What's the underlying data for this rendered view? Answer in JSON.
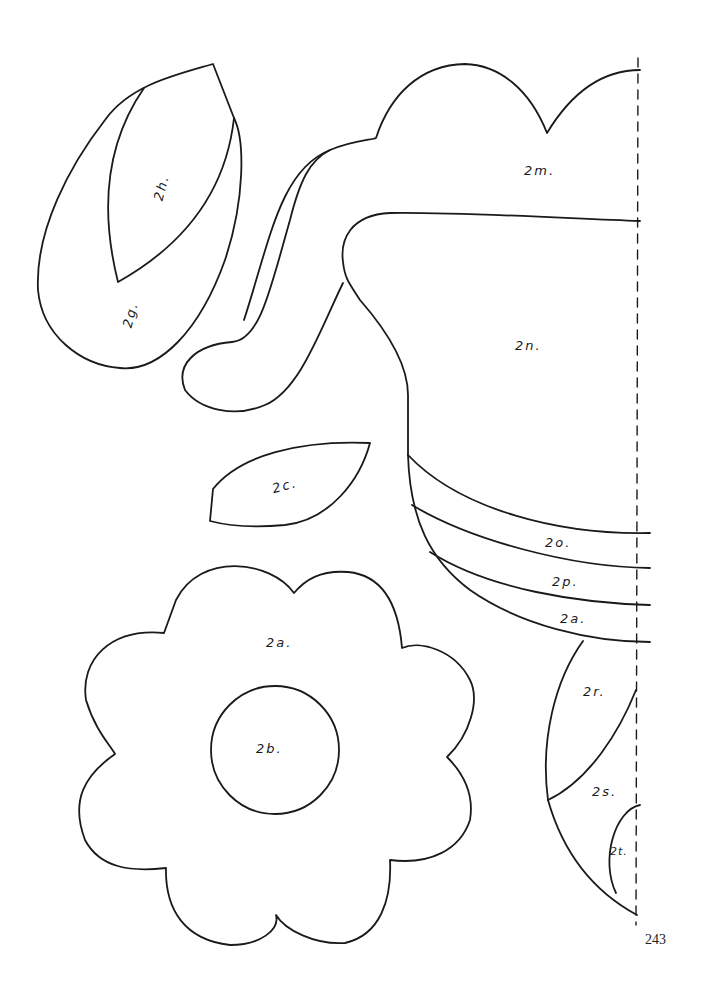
{
  "pattern_pieces": [
    {
      "id": "2a",
      "label": "2a.",
      "shape": "eight-petal flower"
    },
    {
      "id": "2b",
      "label": "2b.",
      "shape": "circle (flower center)"
    },
    {
      "id": "2c",
      "label": "2c.",
      "shape": "leaf"
    },
    {
      "id": "2g",
      "label": "2g.",
      "shape": "large leaf"
    },
    {
      "id": "2h",
      "label": "2h.",
      "shape": "inner leaf vein"
    },
    {
      "id": "2m",
      "label": "2m.",
      "shape": "scalloped top"
    },
    {
      "id": "2n",
      "label": "2n.",
      "shape": "body with curled stem"
    },
    {
      "id": "2o",
      "label": "2o.",
      "shape": "band"
    },
    {
      "id": "2p",
      "label": "2p.",
      "shape": "band"
    },
    {
      "id": "2q",
      "label": "2a.",
      "shape": "band"
    },
    {
      "id": "2r",
      "label": "2r.",
      "shape": "wedge"
    },
    {
      "id": "2s",
      "label": "2s.",
      "shape": "wedge"
    },
    {
      "id": "2t",
      "label": "2t.",
      "shape": "small wedge"
    }
  ],
  "fold_line": "dashed vertical place-on-fold line",
  "page_number": "243",
  "colors": {
    "ink": "#1a1a1a",
    "paper": "#ffffff"
  }
}
